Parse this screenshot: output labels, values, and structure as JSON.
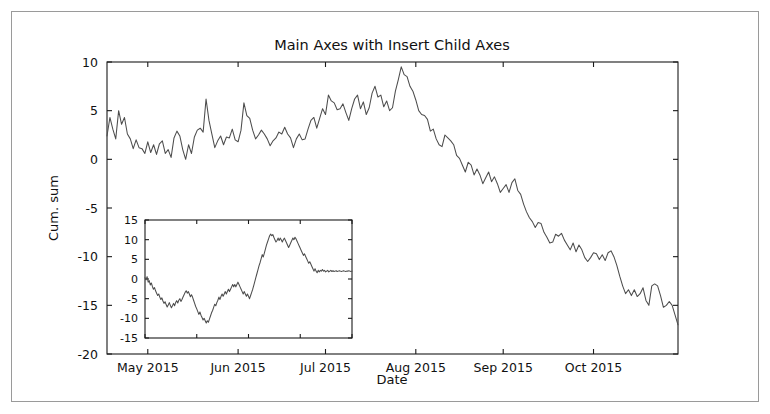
{
  "figure": {
    "title": "Main Axes with Insert Child Axes",
    "background_color": "#ffffff",
    "frame_color": "#9a9a9a",
    "line_color": "#4d4d4d",
    "axis_color": "#1a1a1a"
  },
  "chart_data": [
    {
      "id": "main-axes",
      "type": "line",
      "title": "Main Axes with Insert Child Axes",
      "xlabel": "Date",
      "ylabel": "Cum. sum",
      "grid": false,
      "legend": null,
      "xtick_labels": [
        "May 2015",
        "Jun 2015",
        "Jul 2015",
        "Aug 2015",
        "Sep 2015",
        "Oct 2015"
      ],
      "xtick_positions": [
        14,
        45,
        75,
        106,
        136,
        167
      ],
      "ytick_labels": [
        "10",
        "5",
        "0",
        "-5",
        "-10",
        "-15",
        "-20"
      ],
      "ytick_values": [
        10,
        5,
        0,
        -5,
        -10,
        -15,
        -20
      ],
      "ylim": [
        -20,
        10
      ],
      "xlim": [
        0,
        196
      ],
      "series": [
        {
          "name": "Cum. sum",
          "x": [
            0,
            1,
            2,
            3,
            4,
            5,
            6,
            7,
            8,
            9,
            10,
            11,
            12,
            13,
            14,
            15,
            16,
            17,
            18,
            19,
            20,
            21,
            22,
            23,
            24,
            25,
            26,
            27,
            28,
            29,
            30,
            31,
            32,
            33,
            34,
            35,
            36,
            37,
            38,
            39,
            40,
            41,
            42,
            43,
            44,
            45,
            46,
            47,
            48,
            49,
            50,
            51,
            52,
            53,
            54,
            55,
            56,
            57,
            58,
            59,
            60,
            61,
            62,
            63,
            64,
            65,
            66,
            67,
            68,
            69,
            70,
            71,
            72,
            73,
            74,
            75,
            76,
            77,
            78,
            79,
            80,
            81,
            82,
            83,
            84,
            85,
            86,
            87,
            88,
            89,
            90,
            91,
            92,
            93,
            94,
            95,
            96,
            97,
            98,
            99,
            100,
            101,
            102,
            103,
            104,
            105,
            106,
            107,
            108,
            109,
            110,
            111,
            112,
            113,
            114,
            115,
            116,
            117,
            118,
            119,
            120,
            121,
            122,
            123,
            124,
            125,
            126,
            127,
            128,
            129,
            130,
            131,
            132,
            133,
            134,
            135,
            136,
            137,
            138,
            139,
            140,
            141,
            142,
            143,
            144,
            145,
            146,
            147,
            148,
            149,
            150,
            151,
            152,
            153,
            154,
            155,
            156,
            157,
            158,
            159,
            160,
            161,
            162,
            163,
            164,
            165,
            166,
            167,
            168,
            169,
            170,
            171,
            172,
            173,
            174,
            175,
            176,
            177,
            178,
            179,
            180,
            181,
            182,
            183,
            184,
            185,
            186,
            187,
            188,
            189,
            190,
            191,
            192,
            193,
            194,
            195,
            196
          ],
          "y": [
            2.4,
            4.3,
            3.1,
            2.1,
            5.0,
            3.6,
            4.3,
            2.6,
            2.1,
            1.1,
            2.0,
            1.2,
            1.1,
            0.6,
            1.8,
            0.7,
            1.5,
            0.5,
            1.6,
            1.9,
            0.6,
            1.0,
            0.2,
            2.2,
            2.9,
            2.4,
            1.0,
            0.0,
            1.5,
            0.6,
            2.3,
            3.0,
            3.2,
            2.8,
            6.2,
            4.0,
            2.6,
            1.2,
            1.9,
            2.4,
            1.5,
            2.3,
            2.2,
            3.1,
            2.0,
            1.8,
            3.0,
            5.8,
            4.5,
            4.2,
            3.0,
            2.1,
            2.5,
            3.0,
            2.6,
            2.1,
            1.4,
            1.9,
            2.2,
            2.8,
            2.6,
            3.3,
            2.6,
            2.2,
            1.2,
            2.1,
            2.6,
            2.0,
            2.1,
            3.1,
            4.0,
            4.3,
            3.2,
            4.2,
            5.2,
            4.6,
            6.6,
            6.0,
            5.8,
            5.1,
            5.2,
            5.7,
            4.8,
            4.0,
            5.2,
            6.2,
            6.6,
            5.2,
            5.9,
            4.6,
            5.3,
            6.8,
            7.5,
            6.4,
            6.6,
            5.4,
            6.0,
            5.0,
            5.3,
            7.0,
            8.2,
            9.5,
            8.7,
            8.5,
            7.5,
            7.0,
            6.1,
            5.0,
            4.6,
            4.5,
            4.1,
            2.9,
            3.1,
            2.1,
            1.5,
            1.3,
            2.5,
            2.2,
            1.9,
            1.5,
            0.4,
            0.1,
            -0.6,
            -1.3,
            -0.3,
            -0.6,
            -1.6,
            -1.0,
            -1.6,
            -2.5,
            -1.9,
            -1.3,
            -2.3,
            -1.8,
            -2.5,
            -3.4,
            -3.0,
            -2.6,
            -3.4,
            -2.4,
            -2.0,
            -3.2,
            -3.6,
            -4.6,
            -5.4,
            -6.0,
            -6.4,
            -7.0,
            -6.5,
            -6.6,
            -7.5,
            -8.0,
            -8.6,
            -8.5,
            -7.7,
            -7.9,
            -7.6,
            -8.3,
            -8.8,
            -9.3,
            -8.6,
            -9.5,
            -8.8,
            -9.3,
            -10.1,
            -10.5,
            -10.1,
            -9.6,
            -9.7,
            -10.3,
            -9.8,
            -10.4,
            -9.6,
            -9.4,
            -10.0,
            -10.9,
            -12.0,
            -13.0,
            -13.8,
            -13.4,
            -14.0,
            -13.4,
            -14.1,
            -13.8,
            -13.2,
            -14.5,
            -15.0,
            -13.0,
            -12.8,
            -13.0,
            -14.0,
            -15.2,
            -15.0,
            -14.6,
            -15.0,
            -16.0,
            -17.0,
            -16.2
          ]
        }
      ]
    },
    {
      "id": "inset-child-axes",
      "type": "line",
      "title": "",
      "xlabel": "",
      "ylabel": "",
      "grid": false,
      "legend": null,
      "xtick_labels": [],
      "ytick_labels": [
        "15",
        "10",
        "5",
        "0",
        "-5",
        "-10",
        "-15"
      ],
      "ytick_values": [
        15,
        10,
        5,
        0,
        -5,
        -10,
        -15
      ],
      "ylim": [
        -15,
        15
      ],
      "xlim": [
        0,
        196
      ],
      "series": [
        {
          "name": "inset series",
          "x": [
            0,
            1,
            2,
            3,
            4,
            5,
            6,
            7,
            8,
            9,
            10,
            11,
            12,
            13,
            14,
            15,
            16,
            17,
            18,
            19,
            20,
            21,
            22,
            23,
            24,
            25,
            26,
            27,
            28,
            29,
            30,
            31,
            32,
            33,
            34,
            35,
            36,
            37,
            38,
            39,
            40,
            41,
            42,
            43,
            44,
            45,
            46,
            47,
            48,
            49,
            50,
            51,
            52,
            53,
            54,
            55,
            56,
            57,
            58,
            59,
            60,
            61,
            62,
            63,
            64,
            65,
            66,
            67,
            68,
            69,
            70,
            71,
            72,
            73,
            74,
            75,
            76,
            77,
            78,
            79,
            80,
            81,
            82,
            83,
            84,
            85,
            86,
            87,
            88,
            89,
            90,
            91,
            92,
            93,
            94,
            95,
            96,
            97,
            98,
            99,
            100,
            101,
            102,
            103,
            104,
            105,
            106,
            107,
            108,
            109,
            110,
            111,
            112,
            113,
            114,
            115,
            116,
            117,
            118,
            119,
            120,
            121,
            122,
            123,
            124,
            125,
            126,
            127,
            128,
            129,
            130,
            131,
            132,
            133,
            134,
            135,
            136,
            137,
            138,
            139,
            140,
            141,
            142,
            143,
            144,
            145,
            146,
            147,
            148,
            149,
            150,
            151,
            152,
            153,
            154,
            155,
            156,
            157,
            158,
            159,
            160,
            161,
            162,
            163,
            164,
            165,
            166,
            167,
            168,
            169,
            170,
            171,
            172,
            173,
            174,
            175,
            176,
            177,
            178,
            179,
            180,
            181,
            182,
            183,
            184,
            185,
            186,
            187,
            188,
            189,
            190,
            191,
            192,
            193,
            194,
            195,
            196
          ],
          "y": [
            0.3,
            -0.2,
            0.6,
            -0.8,
            -0.4,
            -1.5,
            -1.0,
            -1.9,
            -2.6,
            -2.2,
            -3.0,
            -3.6,
            -4.2,
            -3.8,
            -4.6,
            -5.2,
            -4.8,
            -5.6,
            -6.2,
            -5.8,
            -6.5,
            -7.1,
            -6.6,
            -6.0,
            -6.7,
            -7.3,
            -6.8,
            -6.2,
            -6.8,
            -6.0,
            -5.5,
            -6.1,
            -5.4,
            -5.0,
            -5.7,
            -5.2,
            -4.6,
            -4.0,
            -3.4,
            -3.0,
            -3.6,
            -3.2,
            -3.8,
            -4.5,
            -4.0,
            -4.6,
            -5.4,
            -6.2,
            -7.0,
            -7.6,
            -8.3,
            -9.0,
            -8.4,
            -9.2,
            -9.8,
            -10.4,
            -10.0,
            -10.6,
            -11.2,
            -10.6,
            -11.0,
            -10.2,
            -9.4,
            -8.6,
            -8.0,
            -7.2,
            -6.4,
            -6.8,
            -6.0,
            -5.4,
            -4.6,
            -5.2,
            -4.4,
            -3.8,
            -4.4,
            -3.8,
            -3.2,
            -3.8,
            -3.2,
            -2.6,
            -3.2,
            -2.6,
            -2.0,
            -1.4,
            -2.0,
            -1.4,
            -2.0,
            -1.4,
            -0.8,
            -1.4,
            -2.0,
            -2.6,
            -3.2,
            -3.8,
            -3.2,
            -3.8,
            -4.4,
            -3.8,
            -4.4,
            -5.0,
            -4.2,
            -3.4,
            -2.6,
            -1.6,
            -0.6,
            0.4,
            1.4,
            2.4,
            3.4,
            4.2,
            5.2,
            6.2,
            5.6,
            6.6,
            7.6,
            8.6,
            9.4,
            10.2,
            11.0,
            11.4,
            11.0,
            11.3,
            10.6,
            10.0,
            9.4,
            9.8,
            10.4,
            9.8,
            10.4,
            10.0,
            9.4,
            10.0,
            10.4,
            9.8,
            9.2,
            8.6,
            8.0,
            8.6,
            9.2,
            9.8,
            10.4,
            10.0,
            10.6,
            10.2,
            9.6,
            9.0,
            8.4,
            7.8,
            7.2,
            6.6,
            6.0,
            6.4,
            5.8,
            5.2,
            4.6,
            4.0,
            4.4,
            3.8,
            3.2,
            2.6,
            2.0,
            2.6,
            2.0,
            1.6,
            2.2,
            1.8,
            2.2,
            2.0,
            2.4,
            2.0,
            2.2,
            1.8,
            2.0,
            2.2,
            1.8,
            2.0,
            2.2,
            1.9,
            2.1,
            1.9,
            2.0,
            2.1,
            1.9,
            2.0,
            2.1,
            2.0,
            1.9,
            2.0,
            2.1,
            2.0,
            1.9,
            2.0,
            2.0,
            2.1,
            2.0,
            1.9,
            2.0,
            2.0,
            2.0
          ]
        }
      ]
    }
  ]
}
